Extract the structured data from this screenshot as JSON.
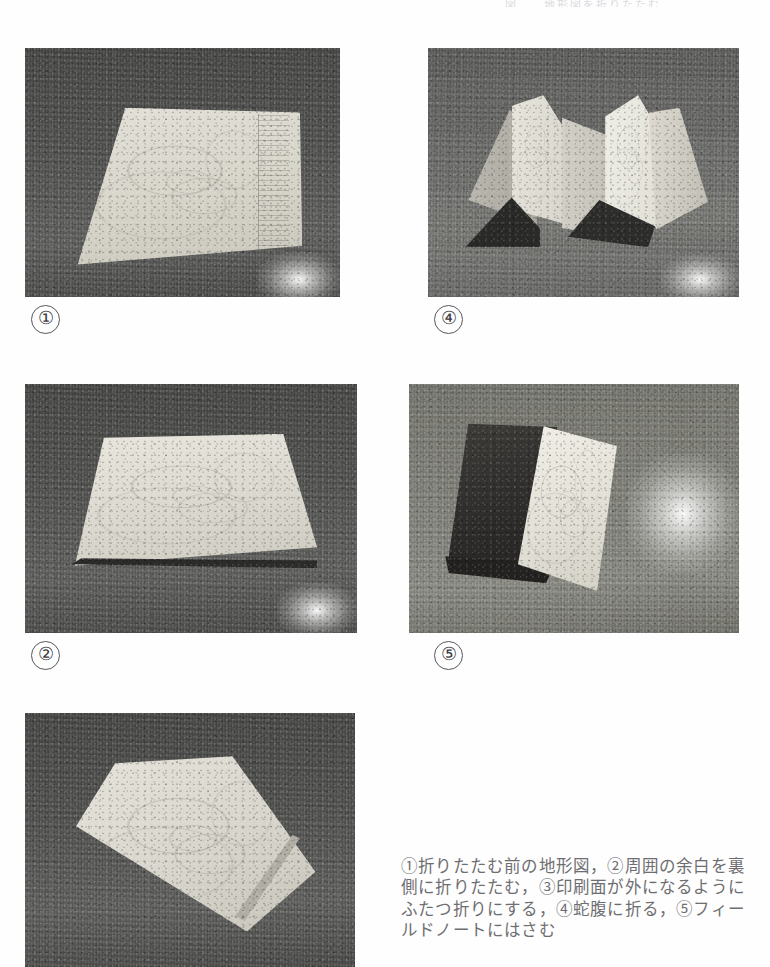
{
  "page": {
    "header_fragment": "図　　地形図を折りたたむ　　　",
    "background_color": "#fefefe",
    "caption_color": "#6e6e72"
  },
  "figures": [
    {
      "id": "fig-1",
      "number": "①",
      "alt": "flat unfolded topographic map lying on a dark stone surface",
      "position": {
        "x": 25,
        "y": 48,
        "width": 315,
        "height": 249
      },
      "label_position": {
        "x": 31,
        "y": 305
      }
    },
    {
      "id": "fig-4",
      "number": "④",
      "alt": "map folded in accordion zig-zag standing upright",
      "position": {
        "x": 428,
        "y": 48,
        "width": 311,
        "height": 249
      },
      "label_position": {
        "x": 434,
        "y": 305
      }
    },
    {
      "id": "fig-2",
      "number": "②",
      "alt": "map with surrounding margins folded to the back lying flat",
      "position": {
        "x": 25,
        "y": 384,
        "width": 332,
        "height": 249
      },
      "label_position": {
        "x": 31,
        "y": 641
      }
    },
    {
      "id": "fig-5",
      "number": "⑤",
      "alt": "folded map tucked into a dark field notebook",
      "position": {
        "x": 409,
        "y": 384,
        "width": 330,
        "height": 249
      },
      "label_position": {
        "x": 434,
        "y": 641
      }
    },
    {
      "id": "fig-3",
      "number": "③",
      "alt": "map folded in half with the printed face outward",
      "position": {
        "x": 25,
        "y": 713,
        "width": 330,
        "height": 254
      },
      "label_position": null
    }
  ],
  "caption": {
    "text": "①折りたたむ前の地形図，②周囲の余白を裏側に折りたたむ，③印刷面が外になるようにふたつ折りにする，④蛇腹に折る，⑤フィールドノートにはさむ",
    "lines": [
      "①折りたたむ前の地形図，②周囲の余白",
      "を裏側に折りたたむ，③印刷面が外にな",
      "るようにふたつ折りにする，④蛇腹に折",
      "る，⑤フィールドノートにはさむ"
    ]
  }
}
